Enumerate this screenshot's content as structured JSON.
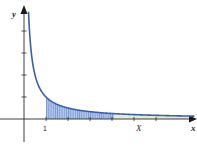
{
  "chart_data": {
    "type": "line",
    "title": "",
    "function": "y = 1/x",
    "xlabel": "x",
    "ylabel": "y",
    "x_tick_labels": [
      "1"
    ],
    "x_ticks": [
      1,
      2,
      3,
      4,
      5,
      6
    ],
    "y_ticks": [
      1,
      2,
      3,
      4
    ],
    "annotations": [
      {
        "text": "X",
        "x": 4.2,
        "note": "upper limit of shaded region"
      },
      {
        "text": "1",
        "x": 1,
        "note": "lower limit of shaded region"
      }
    ],
    "shaded_region": {
      "from": 1,
      "to": 4.1,
      "pattern": "vertical hatching"
    },
    "xlim": [
      -1,
      7
    ],
    "ylim": [
      -1,
      5.3
    ],
    "grid": false,
    "legend": null
  },
  "labels": {
    "y_axis": "y",
    "x_axis": "x",
    "upper_limit": "X",
    "one": "1"
  },
  "colors": {
    "curve": "#3b5fa8",
    "shade": "#a9bfe6",
    "hatch": "#5d7fc4",
    "axis": "#2b2b2b"
  }
}
